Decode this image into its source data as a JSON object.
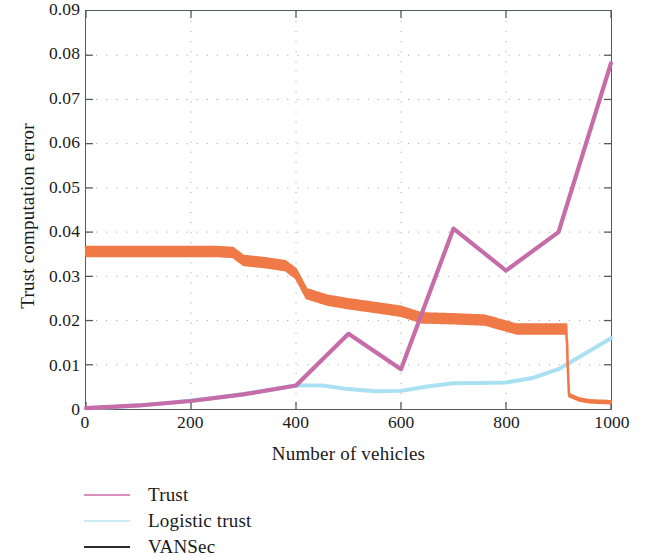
{
  "chart_data": {
    "type": "line",
    "title": "",
    "xlabel": "Number of vehicles",
    "ylabel": "Trust computation error",
    "xlim": [
      0,
      1000
    ],
    "ylim": [
      0,
      0.09
    ],
    "xticks": [
      "0",
      "200",
      "400",
      "600",
      "800",
      "1000"
    ],
    "xtick_values": [
      0,
      200,
      400,
      600,
      800,
      1000
    ],
    "yticks": [
      "0",
      "0.01",
      "0.02",
      "0.03",
      "0.04",
      "0.05",
      "0.06",
      "0.07",
      "0.08",
      "0.09"
    ],
    "ytick_values": [
      0,
      0.01,
      0.02,
      0.03,
      0.04,
      0.05,
      0.06,
      0.07,
      0.08,
      0.09
    ],
    "grid": "dotted",
    "legend_position": "below-left",
    "series": [
      {
        "name": "Trust",
        "color": "#c56ca9",
        "x": [
          0,
          100,
          200,
          300,
          400,
          500,
          600,
          700,
          800,
          900,
          1000
        ],
        "values": [
          0.0002,
          0.0008,
          0.0018,
          0.0033,
          0.0053,
          0.017,
          0.009,
          0.0408,
          0.0313,
          0.04,
          0.0782
        ]
      },
      {
        "name": "Logistic trust",
        "color": "#a9e1f2",
        "x": [
          0,
          50,
          100,
          150,
          200,
          250,
          300,
          350,
          400,
          450,
          500,
          550,
          600,
          650,
          700,
          750,
          800,
          850,
          900,
          950,
          1000
        ],
        "values": [
          0.0002,
          0.0004,
          0.0008,
          0.0013,
          0.0019,
          0.0026,
          0.0034,
          0.0043,
          0.0053,
          0.0053,
          0.0045,
          0.004,
          0.0041,
          0.0051,
          0.0058,
          0.0059,
          0.006,
          0.007,
          0.009,
          0.0125,
          0.016
        ]
      },
      {
        "name": "VANSec",
        "color": "#ef7a48",
        "x": [
          0,
          50,
          100,
          150,
          200,
          250,
          280,
          300,
          340,
          380,
          400,
          420,
          460,
          500,
          560,
          600,
          640,
          700,
          760,
          820,
          880,
          915,
          920,
          940,
          960,
          1000
        ],
        "values": [
          0.035,
          0.035,
          0.035,
          0.035,
          0.035,
          0.035,
          0.0348,
          0.033,
          0.0325,
          0.0318,
          0.03,
          0.0255,
          0.024,
          0.0232,
          0.0222,
          0.0215,
          0.02,
          0.0198,
          0.0195,
          0.0175,
          0.0175,
          0.0175,
          0.003,
          0.002,
          0.0016,
          0.0014
        ],
        "style": "oscillating",
        "note": "high-frequency sawtooth oscillation with step drop near x=920"
      }
    ]
  },
  "legend": {
    "items": [
      {
        "label": "Trust",
        "color": "#d98fbf"
      },
      {
        "label": "Logistic trust",
        "color": "#c9ecf5"
      },
      {
        "label": "VANSec",
        "color": "#2b2b2b"
      }
    ]
  }
}
